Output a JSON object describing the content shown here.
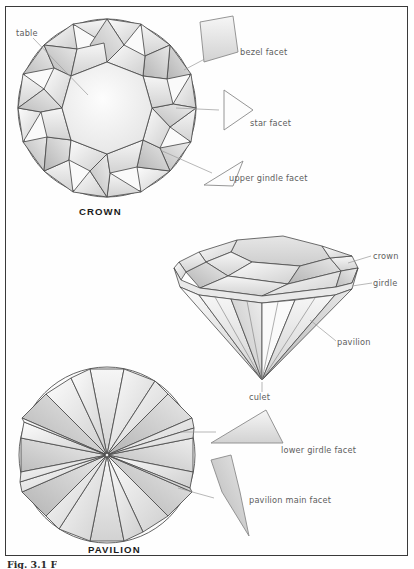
{
  "figure": {
    "caption": "Fig. 3.1 F",
    "border_color": "#3a3a3a",
    "background_color": "#ffffff",
    "line_color": "#4a4a4a",
    "label_color": "#5d5d5d",
    "facet_fill_light": "#f2f2f2",
    "facet_fill_mid": "#d8d8d8",
    "facet_fill_dark": "#b9b9b9"
  },
  "views": {
    "crown": {
      "name": "CROWN",
      "labels": {
        "table": "table",
        "bezel_facet": "bezel facet",
        "star_facet": "star facet",
        "upper_girdle_facet": "upper gindle facet"
      }
    },
    "profile": {
      "labels": {
        "crown": "crown",
        "girdle": "girdle",
        "pavilion": "pavilion",
        "culet": "culet"
      }
    },
    "pavilion": {
      "name": "PAVILION",
      "labels": {
        "lower_girdle_facet": "lower girdle facet",
        "pavilion_main_facet": "pavilion main facet"
      }
    }
  }
}
